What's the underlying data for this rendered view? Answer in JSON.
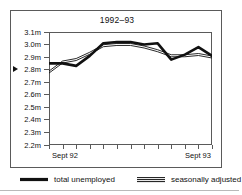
{
  "chart_data": {
    "type": "line",
    "title": "1992–93",
    "xlabel": "",
    "ylabel": "",
    "ylim": [
      2.2,
      3.1
    ],
    "y_ticks": [
      3.1,
      3.0,
      2.9,
      2.8,
      2.7,
      2.6,
      2.5,
      2.4,
      2.3,
      2.2
    ],
    "y_tick_labels": [
      "3.1m",
      "3.0m",
      "2.9m",
      "2.8m",
      "2.7m",
      "2.6m",
      "2.5m",
      "2.4m",
      "2.3m",
      "2.2m"
    ],
    "pointer_value": 2.8,
    "pointer_label": "2.8m",
    "grid": false,
    "legend_position": "bottom",
    "x_tick_count": 13,
    "x": [
      0,
      1,
      2,
      3,
      4,
      5,
      6,
      7,
      8,
      9,
      10,
      11,
      12
    ],
    "x_tick_labels": [
      "Sept 92",
      "",
      "",
      "",
      "",
      "",
      "",
      "",
      "",
      "",
      "",
      "",
      "Sept 93"
    ],
    "x_labeled_ticks": [
      {
        "index": 0,
        "label": "Sept 92"
      },
      {
        "index": 12,
        "label": "Sept 93"
      }
    ],
    "series": [
      {
        "name": "total unemployed",
        "style": "thick-solid",
        "color": "#111111",
        "values": [
          2.85,
          2.85,
          2.83,
          2.91,
          3.01,
          3.02,
          3.02,
          3.0,
          3.01,
          2.88,
          2.92,
          2.98,
          2.91
        ]
      },
      {
        "name": "seasonally adjusted",
        "style": "thin-double",
        "color": "#111111",
        "values": [
          2.78,
          2.86,
          2.88,
          2.93,
          2.99,
          3.0,
          3.0,
          2.98,
          2.95,
          2.91,
          2.91,
          2.92,
          2.9
        ]
      }
    ]
  },
  "legend": {
    "entries": [
      {
        "label": "total unemployed",
        "swatch": "thick-line-swatch"
      },
      {
        "label": "seasonally adjusted",
        "swatch": "double-line-swatch"
      }
    ]
  },
  "colors": {
    "ink": "#111111",
    "frame": "#5a5a5a",
    "background": "#ffffff",
    "rule": "#b9b9b9"
  }
}
